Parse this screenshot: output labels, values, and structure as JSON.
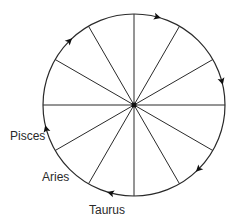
{
  "diagram": {
    "type": "zodiac-wheel",
    "center": {
      "x": 134,
      "y": 105
    },
    "radius": 91,
    "segments": 12,
    "colors": {
      "stroke": "#2a2a2a",
      "background": "#ffffff"
    },
    "labels": [
      {
        "text": "Pisces",
        "x": 10,
        "y": 140
      },
      {
        "text": "Aries",
        "x": 42,
        "y": 181
      },
      {
        "text": "Taurus",
        "x": 89,
        "y": 214
      }
    ],
    "arrows": [
      {
        "name": "arrow-top",
        "angle_deg": -75,
        "direction": "clockwise"
      },
      {
        "name": "arrow-right",
        "angle_deg": -15,
        "direction": "clockwise"
      },
      {
        "name": "arrow-lower-right",
        "angle_deg": 45,
        "direction": "clockwise"
      },
      {
        "name": "arrow-bottom",
        "angle_deg": 105,
        "direction": "clockwise"
      },
      {
        "name": "arrow-left",
        "angle_deg": 165,
        "direction": "clockwise"
      },
      {
        "name": "arrow-upper-left",
        "angle_deg": -135,
        "direction": "clockwise"
      }
    ]
  }
}
